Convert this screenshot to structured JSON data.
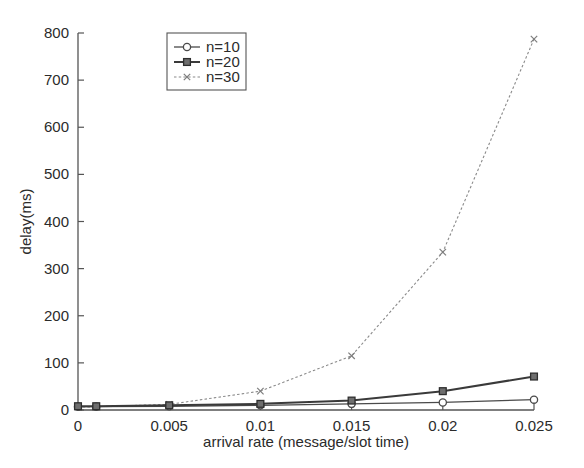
{
  "chart_data": {
    "type": "line",
    "title": "",
    "xlabel": "arrival rate (message/slot time)",
    "ylabel": "delay(ms)",
    "xlim": [
      0,
      0.025
    ],
    "ylim": [
      0,
      800
    ],
    "xticks": [
      "0",
      "0.005",
      "0.01",
      "0.015",
      "0.02",
      "0.025"
    ],
    "xtick_values": [
      0,
      0.005,
      0.01,
      0.015,
      0.02,
      0.025
    ],
    "yticks": [
      "0",
      "100",
      "200",
      "300",
      "400",
      "500",
      "600",
      "700",
      "800"
    ],
    "ytick_values": [
      0,
      100,
      200,
      300,
      400,
      500,
      600,
      700,
      800
    ],
    "grid": false,
    "legend_position": "upper-left-inside",
    "x": [
      0,
      0.001,
      0.005,
      0.01,
      0.015,
      0.02,
      0.025
    ],
    "series": [
      {
        "name": "n=10",
        "marker": "circle-open",
        "linestyle": "solid",
        "color": "#4a4a4a",
        "values": [
          7,
          7,
          8,
          10,
          13,
          16,
          22
        ]
      },
      {
        "name": "n=20",
        "marker": "square-filled",
        "linestyle": "solid",
        "color": "#3a3a3a",
        "values": [
          8,
          8,
          10,
          13,
          20,
          40,
          71
        ]
      },
      {
        "name": "n=30",
        "marker": "x",
        "linestyle": "dotted",
        "color": "#8a8a8a",
        "values": [
          6,
          7,
          12,
          40,
          115,
          335,
          787
        ]
      }
    ]
  },
  "legend": {
    "entries": [
      "n=10",
      "n=20",
      "n=30"
    ]
  },
  "axes": {
    "x_title": "arrival rate (message/slot time)",
    "y_title": "delay(ms)"
  }
}
